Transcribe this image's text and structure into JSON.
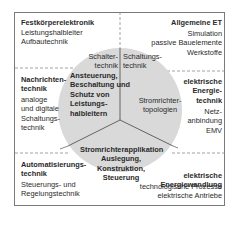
{
  "diagram": {
    "colors": {
      "frame": "#7a7a7a",
      "dashed": "#8a8a8a",
      "circle_fill": "#d9d9d9",
      "divider": "#555555",
      "text": "#2a2a2a"
    },
    "corners": {
      "top_left": {
        "title": "Festkörperelektronik",
        "items": "Leistungshalbleiter\nAufbautechnik"
      },
      "top_right": {
        "title": "Allgemeine ET",
        "items": "Simulation\npassive Bauelemente\nWerkstoffe"
      },
      "middle_left": {
        "title": "Nachrichten-\ntechnik",
        "items": "analoge\nund digitale\nSchaltungs-\ntechnik"
      },
      "middle_right": {
        "title": "elektrische\nEnergie-\ntechnik",
        "items": "Netz-\nanbindung\nEMV"
      },
      "bottom_left": {
        "title": "Automatisierungs-\ntechnik",
        "items": "Steuerungs- und\nRegelungstechnik"
      },
      "bottom_right": {
        "title": "elektrische\nEnergiewandlung",
        "items": "technologische Prozesse\nelektrische Antriebe"
      }
    },
    "circle": {
      "left_segment": {
        "heading": "Schalter-\ntechnik",
        "body": "Ansteuerung,\nBeschaltung und\nSchutz von\nLeistungs-\nhalbleitern"
      },
      "right_segment": {
        "heading": "Schaltungs-\ntechnik",
        "body": "Stromrichter-\ntopologien"
      },
      "bottom_segment": {
        "body": "Stromrichterapplikation\nAuslegung, Konstruktion,\nSteuerung"
      }
    }
  }
}
